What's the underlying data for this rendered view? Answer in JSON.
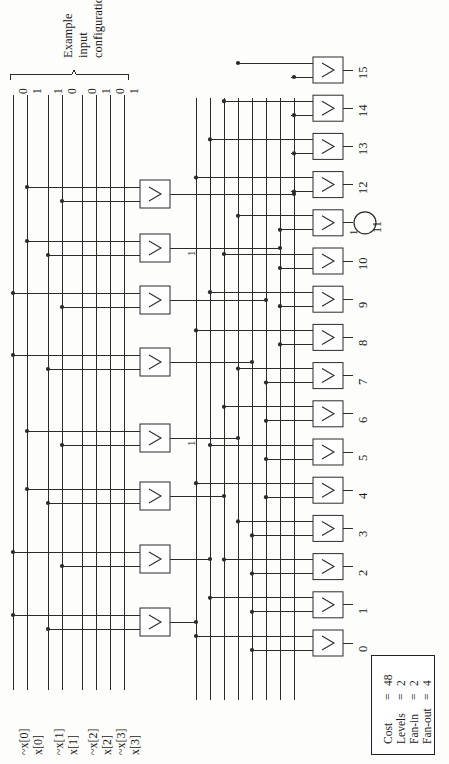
{
  "figure": {
    "annotation_brace_label_lines": [
      "Example",
      "input",
      "configuration"
    ],
    "example_input_bits": [
      "0",
      "1",
      "1",
      "0",
      "0",
      "1",
      "0",
      "1"
    ],
    "rotation_note": "diagram drawn rotated 90 degrees"
  },
  "inputs": [
    {
      "index": 0,
      "label": "~x[0]",
      "bit": "0"
    },
    {
      "index": 1,
      "label": "x[0]",
      "bit": "1"
    },
    {
      "index": 2,
      "label": "~x[1]",
      "bit": "1"
    },
    {
      "index": 3,
      "label": "x[1]",
      "bit": "0"
    },
    {
      "index": 4,
      "label": "~x[2]",
      "bit": "0"
    },
    {
      "index": 5,
      "label": "x[2]",
      "bit": "1"
    },
    {
      "index": 6,
      "label": "~x[3]",
      "bit": "0"
    },
    {
      "index": 7,
      "label": "x[3]",
      "bit": "1"
    }
  ],
  "level1_gates": [
    {
      "id": "L1-0",
      "symbol": "&",
      "active_label": ""
    },
    {
      "id": "L1-1",
      "symbol": "&",
      "active_label": ""
    },
    {
      "id": "L1-2",
      "symbol": "&",
      "active_label": ""
    },
    {
      "id": "L1-3",
      "symbol": "&",
      "active_label": "1"
    },
    {
      "id": "L1-4",
      "symbol": "&",
      "active_label": ""
    },
    {
      "id": "L1-5",
      "symbol": "&",
      "active_label": ""
    },
    {
      "id": "L1-6",
      "symbol": "&",
      "active_label": "1"
    },
    {
      "id": "L1-7",
      "symbol": "&",
      "active_label": ""
    }
  ],
  "output_gates": [
    {
      "number": "0",
      "symbol": "&",
      "active": false,
      "active_label": ""
    },
    {
      "number": "1",
      "symbol": "&",
      "active": false,
      "active_label": ""
    },
    {
      "number": "2",
      "symbol": "&",
      "active": false,
      "active_label": ""
    },
    {
      "number": "3",
      "symbol": "&",
      "active": false,
      "active_label": ""
    },
    {
      "number": "4",
      "symbol": "&",
      "active": false,
      "active_label": ""
    },
    {
      "number": "5",
      "symbol": "&",
      "active": false,
      "active_label": ""
    },
    {
      "number": "6",
      "symbol": "&",
      "active": false,
      "active_label": ""
    },
    {
      "number": "7",
      "symbol": "&",
      "active": false,
      "active_label": ""
    },
    {
      "number": "8",
      "symbol": "&",
      "active": false,
      "active_label": ""
    },
    {
      "number": "9",
      "symbol": "&",
      "active": false,
      "active_label": ""
    },
    {
      "number": "10",
      "symbol": "&",
      "active": false,
      "active_label": ""
    },
    {
      "number": "11",
      "symbol": "&",
      "active": true,
      "active_label": "1"
    },
    {
      "number": "12",
      "symbol": "&",
      "active": false,
      "active_label": ""
    },
    {
      "number": "13",
      "symbol": "&",
      "active": false,
      "active_label": ""
    },
    {
      "number": "14",
      "symbol": "&",
      "active": false,
      "active_label": ""
    },
    {
      "number": "15",
      "symbol": "&",
      "active": false,
      "active_label": ""
    }
  ],
  "legend": {
    "rows": [
      {
        "name": "Cost",
        "eq": "=",
        "value": "48"
      },
      {
        "name": "Levels",
        "eq": "=",
        "value": "2"
      },
      {
        "name": "Fan-in",
        "eq": "=",
        "value": "2"
      },
      {
        "name": "Fan-out",
        "eq": "=",
        "value": "4"
      }
    ]
  },
  "colors": {
    "ink": "#1a1a1a",
    "wire": "#2b2b2b",
    "paper": "#fdfdfc"
  }
}
